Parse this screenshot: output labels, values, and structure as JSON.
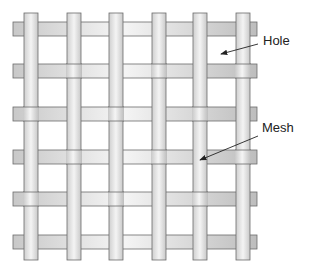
{
  "diagram": {
    "labels": [
      {
        "id": "hole",
        "text": "Hole",
        "x": 263,
        "y": 33,
        "arrow": {
          "x1": 258,
          "y1": 44,
          "x2": 221,
          "y2": 54
        }
      },
      {
        "id": "mesh",
        "text": "Mesh",
        "x": 262,
        "y": 120,
        "arrow": {
          "x1": 258,
          "y1": 136,
          "x2": 200,
          "y2": 160
        }
      }
    ],
    "colors": {
      "strip_light": "#f2f2f2",
      "strip_dark": "#c4c4c4",
      "outline": "#6b6b6b",
      "label": "#222222"
    },
    "vertical_strips_x": [
      24,
      67,
      109,
      152,
      193,
      236
    ],
    "horizontal_strips_y": [
      22,
      64,
      107,
      150,
      192,
      235
    ],
    "strip_width": 14,
    "vertical_extent": [
      13,
      260
    ],
    "horizontal_extent": [
      13,
      257
    ],
    "weave_pattern_V_over": [
      [
        true,
        true,
        true,
        true,
        true,
        true
      ],
      [
        true,
        false,
        true,
        false,
        true,
        false
      ],
      [
        false,
        true,
        false,
        true,
        false,
        true
      ],
      [
        true,
        false,
        true,
        false,
        true,
        false
      ],
      [
        false,
        true,
        false,
        true,
        false,
        true
      ],
      [
        true,
        true,
        true,
        true,
        true,
        true
      ]
    ]
  }
}
